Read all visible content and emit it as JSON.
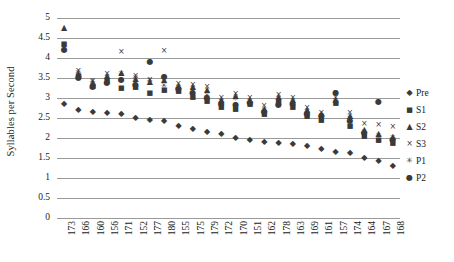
{
  "chart_data": {
    "type": "scatter",
    "title": "",
    "xlabel": "",
    "ylabel": "Syllables per Second",
    "ylim": [
      0,
      5
    ],
    "ytick_labels": [
      "5",
      "4.5",
      "4",
      "3.5",
      "3",
      "2.5",
      "2",
      "1.5",
      "1",
      "0.5",
      "0"
    ],
    "ytick_values": [
      5,
      4.5,
      4,
      3.5,
      3,
      2.5,
      2,
      1.5,
      1,
      0.5,
      0
    ],
    "grid": true,
    "legend_position": "right",
    "categories": [
      "173",
      "166",
      "160",
      "156",
      "171",
      "152",
      "177",
      "180",
      "155",
      "175",
      "179",
      "172",
      "170",
      "151",
      "162",
      "178",
      "163",
      "169",
      "161",
      "157",
      "174",
      "164",
      "167",
      "168"
    ],
    "series": [
      {
        "name": "Pre",
        "marker": "diamond",
        "marker_glyph": "◆",
        "values": [
          2.85,
          2.7,
          2.65,
          2.62,
          2.6,
          2.5,
          2.45,
          2.42,
          2.3,
          2.22,
          2.15,
          2.1,
          2.0,
          1.95,
          1.9,
          1.88,
          1.85,
          1.8,
          1.72,
          1.65,
          1.62,
          1.5,
          1.42,
          1.3
        ]
      },
      {
        "name": "S1",
        "marker": "square",
        "marker_glyph": "■",
        "values": [
          4.35,
          3.55,
          3.3,
          3.42,
          3.25,
          3.28,
          3.12,
          3.2,
          3.18,
          3.02,
          2.92,
          2.78,
          2.72,
          2.85,
          2.6,
          2.9,
          2.78,
          2.55,
          2.45,
          2.88,
          2.3,
          2.05,
          1.95,
          1.88
        ]
      },
      {
        "name": "S2",
        "marker": "triangle",
        "marker_glyph": "▲",
        "values": [
          4.75,
          3.6,
          3.38,
          3.55,
          3.62,
          3.48,
          3.4,
          3.45,
          3.3,
          3.28,
          3.2,
          2.95,
          3.05,
          2.95,
          2.72,
          3.02,
          2.95,
          2.7,
          2.6,
          2.95,
          2.55,
          2.2,
          2.1,
          2.02
        ]
      },
      {
        "name": "S3",
        "marker": "x",
        "marker_glyph": "×",
        "values": [
          4.25,
          3.68,
          3.42,
          3.6,
          4.15,
          3.55,
          3.45,
          4.18,
          3.35,
          3.32,
          3.28,
          3.0,
          3.1,
          3.0,
          2.8,
          3.08,
          3.0,
          2.75,
          2.62,
          3.0,
          2.62,
          2.35,
          2.32,
          2.28
        ]
      },
      {
        "name": "P1",
        "marker": "asterisk",
        "marker_glyph": "✳",
        "values": [
          4.28,
          3.62,
          3.4,
          3.5,
          3.6,
          3.5,
          3.42,
          3.3,
          3.25,
          3.22,
          3.05,
          2.9,
          2.98,
          2.9,
          2.68,
          2.98,
          2.88,
          2.65,
          2.5,
          2.92,
          2.48,
          2.15,
          2.05,
          2.0
        ]
      },
      {
        "name": "P2",
        "marker": "circle",
        "marker_glyph": "●",
        "values": [
          4.2,
          3.5,
          3.28,
          3.38,
          3.45,
          3.32,
          3.9,
          3.52,
          3.22,
          3.12,
          3.0,
          2.85,
          2.82,
          2.88,
          2.65,
          2.82,
          2.85,
          2.6,
          2.55,
          3.12,
          2.42,
          2.12,
          2.9,
          1.95
        ]
      }
    ]
  },
  "legend": {
    "entries": [
      {
        "label": "Pre",
        "glyph": "◆"
      },
      {
        "label": "S1",
        "glyph": "■"
      },
      {
        "label": "S2",
        "glyph": "▲"
      },
      {
        "label": "S3",
        "glyph": "×"
      },
      {
        "label": "P1",
        "glyph": "✳"
      },
      {
        "label": "P2",
        "glyph": "●"
      }
    ]
  },
  "colors": {
    "marker": "#3a3a3a",
    "gridline": "#9a9a9a",
    "text": "#1a1a1a",
    "background": "#ffffff"
  }
}
